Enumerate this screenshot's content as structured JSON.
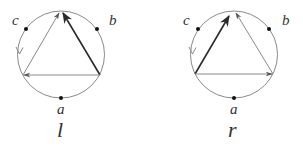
{
  "figure": {
    "colors": {
      "circle": "#8a8a8a",
      "thin_edge": "#8a8a8a",
      "thick_edge": "#2a2a2a",
      "dot": "#111111",
      "text": "#333333"
    },
    "panels": [
      {
        "id": "l",
        "caption": "l",
        "points": {
          "a": "a",
          "b": "b",
          "c": "c"
        },
        "description": "Circle with marked points a (bottom), b (upper right), c (upper left); inscribed triangle. Thick arrow from bottom-right vertex to apex; thin arrow from bottom-left vertex to apex; thin arrow from bottom-right vertex to bottom-left vertex; counterclockwise open arrow on circle near c."
      },
      {
        "id": "r",
        "caption": "r",
        "points": {
          "a": "a",
          "b": "b",
          "c": "c"
        },
        "description": "Circle with marked points a (bottom), b (upper right), c (upper left); inscribed triangle. Thick arrow from bottom-left vertex to apex; thin arrow from bottom-right vertex to apex; thin arrow from bottom-left vertex to bottom-right vertex; counterclockwise open arrow on circle near c."
      }
    ]
  }
}
